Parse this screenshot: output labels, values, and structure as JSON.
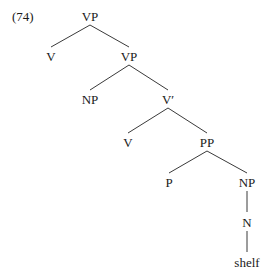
{
  "example_number": "(74)",
  "tree": {
    "nodes": [
      {
        "id": "vp1",
        "label": "VP"
      },
      {
        "id": "v1",
        "label": "V"
      },
      {
        "id": "vp2",
        "label": "VP"
      },
      {
        "id": "np1",
        "label": "NP"
      },
      {
        "id": "vbar",
        "label": "V′"
      },
      {
        "id": "v2",
        "label": "V"
      },
      {
        "id": "pp",
        "label": "PP"
      },
      {
        "id": "p",
        "label": "P"
      },
      {
        "id": "np2",
        "label": "NP"
      },
      {
        "id": "n",
        "label": "N"
      },
      {
        "id": "shelf",
        "label": "shelf"
      }
    ],
    "edges": [
      [
        "vp1",
        "v1"
      ],
      [
        "vp1",
        "vp2"
      ],
      [
        "vp2",
        "np1"
      ],
      [
        "vp2",
        "vbar"
      ],
      [
        "vbar",
        "v2"
      ],
      [
        "vbar",
        "pp"
      ],
      [
        "pp",
        "p"
      ],
      [
        "pp",
        "np2"
      ],
      [
        "np2",
        "n"
      ],
      [
        "n",
        "shelf"
      ]
    ]
  }
}
